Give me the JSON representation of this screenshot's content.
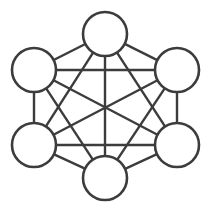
{
  "diagram": {
    "type": "node-link-graph",
    "canvas": {
      "width": 210,
      "height": 210,
      "background": "#ffffff"
    },
    "style": {
      "node_stroke_color": "#3c3c3c",
      "node_fill_color": "#ffffff",
      "node_stroke_width": 2.6,
      "edge_stroke_color": "#3c3c3c",
      "edge_stroke_width": 2.4,
      "node_radius": 22
    },
    "layout": "hexagon",
    "node_count": 6,
    "edge_count": 15,
    "nodes": [
      {
        "id": "top",
        "label": "",
        "cx": 105,
        "cy": 34,
        "r": 22
      },
      {
        "id": "upper-right",
        "label": "",
        "cx": 177,
        "cy": 70,
        "r": 22
      },
      {
        "id": "lower-right",
        "label": "",
        "cx": 177,
        "cy": 145,
        "r": 22
      },
      {
        "id": "bottom",
        "label": "",
        "cx": 105,
        "cy": 178,
        "r": 22
      },
      {
        "id": "lower-left",
        "label": "",
        "cx": 34,
        "cy": 145,
        "r": 22
      },
      {
        "id": "upper-left",
        "label": "",
        "cx": 34,
        "cy": 70,
        "r": 22
      }
    ],
    "edges": [
      {
        "from": "top",
        "to": "upper-right"
      },
      {
        "from": "top",
        "to": "lower-right"
      },
      {
        "from": "top",
        "to": "bottom"
      },
      {
        "from": "top",
        "to": "lower-left"
      },
      {
        "from": "top",
        "to": "upper-left"
      },
      {
        "from": "upper-right",
        "to": "lower-right"
      },
      {
        "from": "upper-right",
        "to": "bottom"
      },
      {
        "from": "upper-right",
        "to": "lower-left"
      },
      {
        "from": "upper-right",
        "to": "upper-left"
      },
      {
        "from": "lower-right",
        "to": "bottom"
      },
      {
        "from": "lower-right",
        "to": "lower-left"
      },
      {
        "from": "lower-right",
        "to": "upper-left"
      },
      {
        "from": "bottom",
        "to": "lower-left"
      },
      {
        "from": "bottom",
        "to": "upper-left"
      },
      {
        "from": "lower-left",
        "to": "upper-left"
      }
    ]
  }
}
